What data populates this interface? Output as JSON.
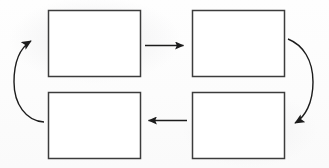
{
  "diagram": {
    "title": "",
    "type": "cycle-flow-diagram",
    "direction": "clockwise",
    "background_color": "#fdfdfd",
    "stroke_color": "#3a3a3a",
    "boxes": [
      {
        "id": "top-left",
        "label": "",
        "x": 48,
        "y": 10,
        "width": 92,
        "height": 66
      },
      {
        "id": "top-right",
        "label": "",
        "x": 192,
        "y": 10,
        "width": 92,
        "height": 66
      },
      {
        "id": "bottom-left",
        "label": "",
        "x": 48,
        "y": 92,
        "width": 92,
        "height": 66
      },
      {
        "id": "bottom-right",
        "label": "",
        "x": 192,
        "y": 92,
        "width": 92,
        "height": 66
      }
    ],
    "connectors": [
      {
        "id": "top-straight-arrow",
        "label": "",
        "shape": "straight",
        "from": "top-left",
        "to": "top-right",
        "points_toward": "right"
      },
      {
        "id": "right-curved-arrow",
        "label": "",
        "shape": "curved",
        "from": "top-right",
        "to": "bottom-right",
        "points_toward": "down-left"
      },
      {
        "id": "bottom-straight-arrow",
        "label": "",
        "shape": "straight",
        "from": "bottom-right",
        "to": "bottom-left",
        "points_toward": "left"
      },
      {
        "id": "left-curved-arrow",
        "label": "",
        "shape": "curved",
        "from": "bottom-left",
        "to": "top-left",
        "points_toward": "up-right"
      }
    ]
  }
}
